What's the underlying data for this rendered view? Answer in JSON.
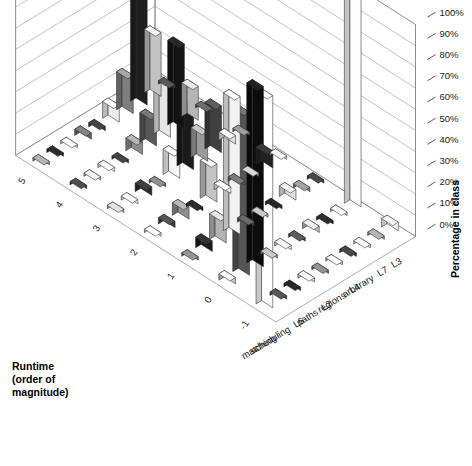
{
  "chart_data": {
    "type": "bar",
    "title": "",
    "subtitle": "",
    "xlabel": "",
    "ylabel": "Runtime (order of magnitude)",
    "zlabel": "Percentage in class",
    "grid": true,
    "legend": "none",
    "projection": "3d-isometric",
    "categories": [
      "matching",
      "scheduling",
      "L6",
      "paths",
      "L2",
      "regions",
      "L4",
      "arbitrary",
      "L7",
      "L3"
    ],
    "runtime_ticks": [
      "-1",
      "0",
      "1",
      "2",
      "3",
      "4",
      "5"
    ],
    "zlim": [
      0,
      100
    ],
    "ztick_labels": [
      "0%",
      "10%",
      "20%",
      "30%",
      "40%",
      "50%",
      "60%",
      "70%",
      "80%",
      "90%",
      "100%"
    ],
    "ztick_values": [
      0,
      10,
      20,
      30,
      40,
      50,
      60,
      70,
      80,
      90,
      100
    ],
    "series_note": "rows are runtime order-of-magnitude bins, columns are problem classes; values are percentage in class",
    "rows": [
      {
        "runtime": "-1",
        "values": [
          100,
          0,
          0,
          2,
          0,
          0,
          0,
          0,
          0,
          4
        ]
      },
      {
        "runtime": "0",
        "values": [
          3,
          77,
          85,
          0,
          2,
          0,
          3,
          0,
          0,
          100
        ]
      },
      {
        "runtime": "1",
        "values": [
          0,
          5,
          12,
          65,
          2,
          0,
          0,
          5,
          2,
          0
        ]
      },
      {
        "runtime": "2",
        "values": [
          0,
          3,
          6,
          0,
          18,
          3,
          2,
          0,
          8,
          0
        ]
      },
      {
        "runtime": "3",
        "values": [
          0,
          2,
          4,
          0,
          12,
          30,
          14,
          22,
          4,
          0
        ]
      },
      {
        "runtime": "4",
        "values": [
          0,
          0,
          2,
          0,
          6,
          14,
          26,
          40,
          16,
          0
        ]
      },
      {
        "runtime": "5",
        "values": [
          0,
          0,
          0,
          3,
          2,
          8,
          18,
          62,
          30,
          0
        ]
      }
    ],
    "bar_shades": [
      [
        "#ffffff",
        "#3a3a3a",
        "#111111",
        "#d9d9d9",
        "#6e6e6e",
        "#c8c8c8",
        "#2b2b2b",
        "#efefef",
        "#8a8a8a",
        "#f7f7f7"
      ],
      [
        "#c8c8c8",
        "#555555",
        "#0d0d0d",
        "#9c9c9c",
        "#e8e8e8",
        "#3f3f3f",
        "#bdbdbd",
        "#171717",
        "#d2d2d2",
        "#fdfdfd"
      ],
      [
        "#6e6e6e",
        "#1c1c1c",
        "#b4b4b4",
        "#f2f2f2",
        "#4a4a4a",
        "#9c9c9c",
        "#101010",
        "#dedede",
        "#7a7a7a",
        "#2e2e2e"
      ],
      [
        "#dcdcdc",
        "#3a3a3a",
        "#8e8e8e",
        "#151515",
        "#c4c4c4",
        "#efefef",
        "#5a5a5a",
        "#a8a8a8",
        "#222222",
        "#cfcfcf"
      ],
      [
        "#b0b0b0",
        "#efefef",
        "#282828",
        "#6a6a6a",
        "#f5f5f5",
        "#1a1a1a",
        "#9a9a9a",
        "#404040",
        "#e0e0e0",
        "#767676"
      ],
      [
        "#343434",
        "#c0c0c0",
        "#f6f6f6",
        "#2a2a2a",
        "#8c8c8c",
        "#585858",
        "#e6e6e6",
        "#131313",
        "#b6b6b6",
        "#4e4e4e"
      ],
      [
        "#8a8a8a",
        "#161616",
        "#d6d6d6",
        "#606060",
        "#2c2c2c",
        "#ededed",
        "#7e7e7e",
        "#1f1f1f",
        "#c2c2c2",
        "#3c3c3c"
      ]
    ]
  },
  "axes": {
    "runtime_title_line1": "Runtime",
    "runtime_title_line2": "(order of",
    "runtime_title_line3": "magnitude)",
    "percentage_title": "Percentage in class"
  }
}
